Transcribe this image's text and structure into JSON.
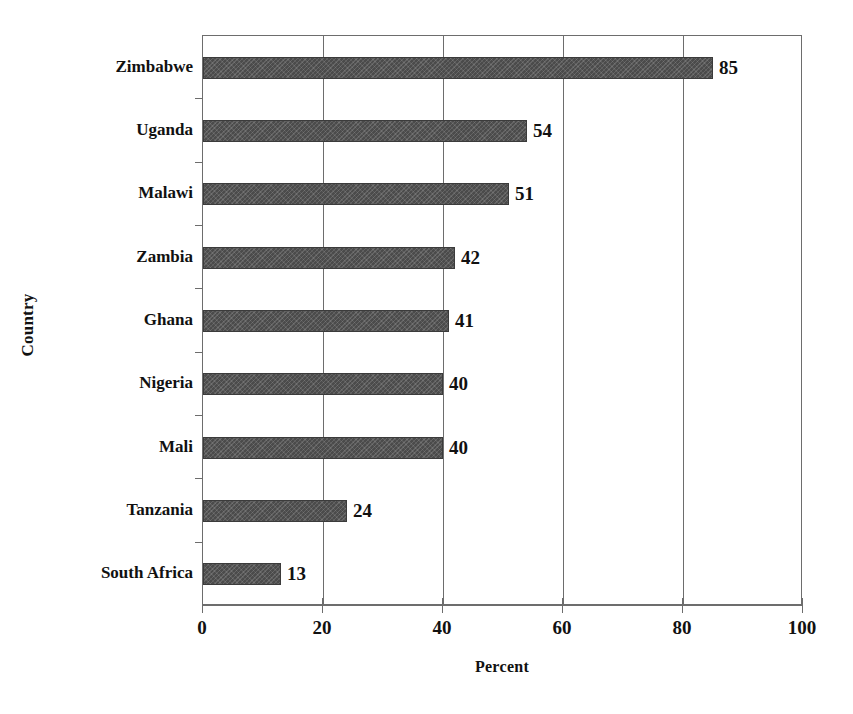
{
  "chart_data": {
    "type": "bar",
    "orientation": "horizontal",
    "title": "",
    "xlabel": "Percent",
    "ylabel": "Country",
    "categories": [
      "Zimbabwe",
      "Uganda",
      "Malawi",
      "Zambia",
      "Ghana",
      "Nigeria",
      "Mali",
      "Tanzania",
      "South Africa"
    ],
    "values": [
      85,
      54,
      51,
      42,
      41,
      40,
      40,
      24,
      13
    ],
    "value_labels": [
      "85",
      "54",
      "51",
      "42",
      "41",
      "40",
      "40",
      "24",
      "13"
    ],
    "xlim": [
      0,
      100
    ],
    "xticks": [
      0,
      20,
      40,
      60,
      80,
      100
    ],
    "xtick_labels": [
      "0",
      "20",
      "40",
      "60",
      "80",
      "100"
    ],
    "grid": "vertical",
    "legend": "none",
    "bar_color": "#4b4b4b",
    "axis_color": "#6d6d6d",
    "text_color": "#111111"
  },
  "artifact": {
    "top_edge_text": ""
  }
}
